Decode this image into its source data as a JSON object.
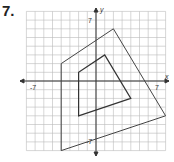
{
  "problem_number": "7.",
  "axes": {
    "x_label": "x",
    "y_label": "y",
    "tick_neg_x": "-7",
    "tick_pos_x": "7",
    "tick_pos_y": "7",
    "tick_neg_y": "-7"
  },
  "grid": {
    "min": -8,
    "max": 8
  },
  "figures": {
    "outer": [
      [
        2,
        6
      ],
      [
        8,
        -4
      ],
      [
        -4,
        -8
      ],
      [
        -4,
        2
      ]
    ],
    "inner": [
      [
        1,
        3
      ],
      [
        4,
        -2
      ],
      [
        -2,
        -4
      ],
      [
        -2,
        1
      ]
    ]
  }
}
